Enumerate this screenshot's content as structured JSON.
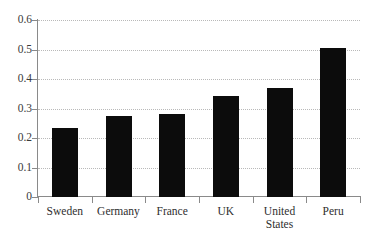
{
  "chart_data": {
    "type": "bar",
    "title": "",
    "subtitle": "",
    "xlabel": "",
    "ylabel": "",
    "categories": [
      "Sweden",
      "Germany",
      "France",
      "UK",
      "United States",
      "Peru"
    ],
    "values": [
      0.235,
      0.275,
      0.28,
      0.342,
      0.37,
      0.506
    ],
    "ylim": [
      0,
      0.6
    ],
    "ytick_labels": [
      "0",
      "0.1",
      "0.2",
      "0.3",
      "0.4",
      "0.5",
      "0.6"
    ],
    "ytick_values": [
      0,
      0.1,
      0.2,
      0.3,
      0.4,
      0.5,
      0.6
    ],
    "grid": true,
    "grid_axis": "y",
    "grid_style": "dotted",
    "legend": false,
    "legend_position": "none",
    "bar_color": "#0c0c0c",
    "axis_color": "#8a8a8a",
    "grid_color": "#b9b9b9",
    "background_color": "#ffffff",
    "annotations": []
  },
  "axis": {
    "y_ticks": [
      {
        "label": "0.6",
        "value": 0.6
      },
      {
        "label": "0.5",
        "value": 0.5
      },
      {
        "label": "0.4",
        "value": 0.4
      },
      {
        "label": "0.3",
        "value": 0.3
      },
      {
        "label": "0.2",
        "value": 0.2
      },
      {
        "label": "0.1",
        "value": 0.1
      },
      {
        "label": "0",
        "value": 0
      }
    ],
    "x_categories": [
      {
        "label": "Sweden",
        "value": 0.235
      },
      {
        "label": "Germany",
        "value": 0.275
      },
      {
        "label": "France",
        "value": 0.28
      },
      {
        "label": "UK",
        "value": 0.342
      },
      {
        "label": "United\nStates",
        "value": 0.37
      },
      {
        "label": "Peru",
        "value": 0.506
      }
    ]
  }
}
